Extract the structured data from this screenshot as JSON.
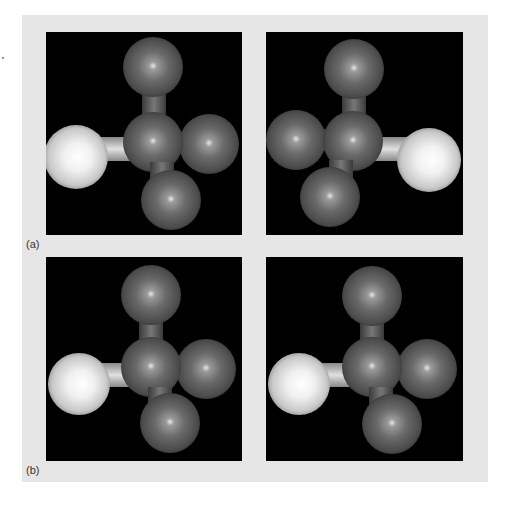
{
  "figure": {
    "background_color": "#e6e6e6",
    "panel_background": "#000000",
    "labels": {
      "a": "(a)",
      "b": "(b)"
    }
  },
  "panels": [
    {
      "id": "a-left",
      "description": "Tetrahedral molecule, light atom on left",
      "light_atom": "left"
    },
    {
      "id": "a-right",
      "description": "Mirror image, light atom on right",
      "light_atom": "right"
    },
    {
      "id": "b-left",
      "description": "Tetrahedral molecule, light atom on left",
      "light_atom": "left"
    },
    {
      "id": "b-right",
      "description": "Rotated mirror image, light atom on left",
      "light_atom": "left"
    }
  ],
  "colors": {
    "dark_atom": "#5a5a5a",
    "light_atom": "#f2f2f2",
    "bond": "#6a6a6a"
  }
}
